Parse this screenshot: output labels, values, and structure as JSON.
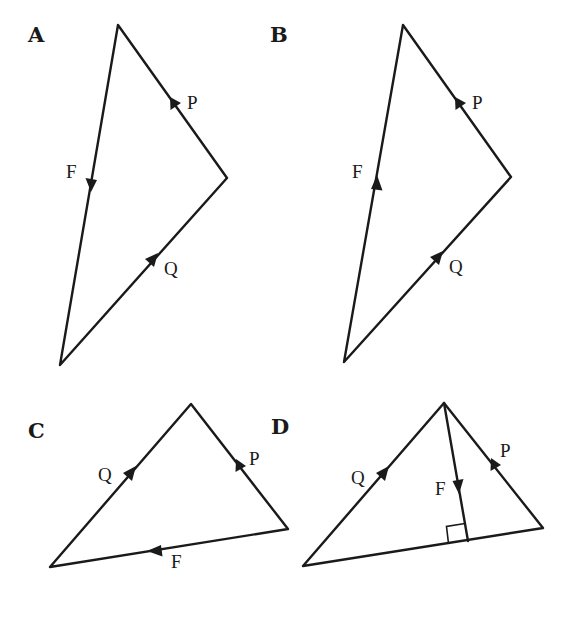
{
  "figure": {
    "options": [
      {
        "label": "A",
        "vectors": [
          {
            "name": "F",
            "direction": "down along left side"
          },
          {
            "name": "P",
            "direction": "up-left along upper right side"
          },
          {
            "name": "Q",
            "direction": "up-right along lower right side"
          }
        ]
      },
      {
        "label": "B",
        "vectors": [
          {
            "name": "F",
            "direction": "up along left side"
          },
          {
            "name": "P",
            "direction": "up-left along upper right side"
          },
          {
            "name": "Q",
            "direction": "up-right along lower right side"
          }
        ]
      },
      {
        "label": "C",
        "vectors": [
          {
            "name": "Q",
            "direction": "up-right along left side"
          },
          {
            "name": "P",
            "direction": "up-left along right side"
          },
          {
            "name": "F",
            "direction": "left along base"
          }
        ]
      },
      {
        "label": "D",
        "vectors": [
          {
            "name": "Q",
            "direction": "up-right along left side"
          },
          {
            "name": "P",
            "direction": "up-left along right side"
          },
          {
            "name": "F",
            "direction": "down, perpendicular to base (right-angle mark)"
          }
        ]
      }
    ]
  },
  "colors": {
    "ink": "#1a1a1a",
    "background": "#ffffff"
  }
}
